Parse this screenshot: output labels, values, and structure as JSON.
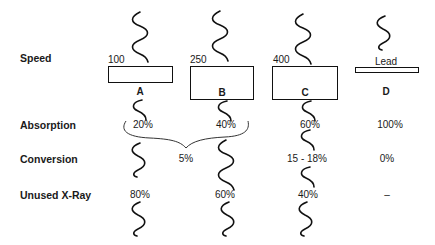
{
  "row_labels": {
    "speed": "Speed",
    "absorption": "Absorption",
    "conversion": "Conversion",
    "unused": "Unused X-Ray"
  },
  "columns": [
    {
      "id": "A",
      "label": "A",
      "speed": "100",
      "absorption": "20%",
      "conversion": "",
      "unused": "80%"
    },
    {
      "id": "B",
      "label": "B",
      "speed": "250",
      "absorption": "40%",
      "conversion": "",
      "unused": "60%"
    },
    {
      "id": "C",
      "label": "C",
      "speed": "400",
      "absorption": "60%",
      "conversion": "15 - 18%",
      "unused": "40%"
    },
    {
      "id": "D",
      "label": "D",
      "speed": "",
      "plate_label": "Lead",
      "absorption": "100%",
      "conversion": "0%",
      "unused": "–"
    }
  ],
  "shared": {
    "ab_conversion": "5%"
  },
  "icons": {
    "wave": "x-ray-wave-icon",
    "brace": "brace-icon"
  },
  "colors": {
    "ink": "#111111",
    "background": "#ffffff"
  }
}
